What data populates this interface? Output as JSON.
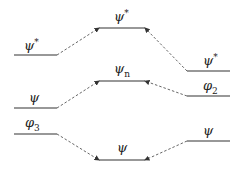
{
  "diagram": {
    "type": "orbital-energy-level-diagram",
    "levels": [
      {
        "id": "left-top",
        "label": "ψ",
        "sup": "*",
        "sub": "",
        "x1": 14,
        "x2": 57,
        "y": 55,
        "lx": 24,
        "ly": 38
      },
      {
        "id": "center-top",
        "label": "ψ",
        "sup": "*",
        "sub": "",
        "x1": 99,
        "x2": 145,
        "y": 28,
        "lx": 114,
        "ly": 9
      },
      {
        "id": "right-top",
        "label": "ψ",
        "sup": "*",
        "sub": "",
        "x1": 187,
        "x2": 230,
        "y": 71,
        "lx": 203,
        "ly": 53
      },
      {
        "id": "left-middle",
        "label": "ψ",
        "sup": "",
        "sub": "",
        "x1": 14,
        "x2": 57,
        "y": 108,
        "lx": 29,
        "ly": 91
      },
      {
        "id": "center-middle",
        "label": "ψ",
        "sup": "",
        "sub": "n",
        "x1": 99,
        "x2": 145,
        "y": 81,
        "lx": 114,
        "ly": 62
      },
      {
        "id": "right-middle",
        "label": "φ",
        "sup": "",
        "sub": "2",
        "x1": 187,
        "x2": 230,
        "y": 96,
        "lx": 203,
        "ly": 79
      },
      {
        "id": "left-bottom",
        "label": "φ",
        "sup": "",
        "sub": "3",
        "x1": 14,
        "x2": 57,
        "y": 134,
        "lx": 25,
        "ly": 116
      },
      {
        "id": "center-bottom",
        "label": "ψ",
        "sup": "",
        "sub": "",
        "x1": 99,
        "x2": 145,
        "y": 160,
        "lx": 117,
        "ly": 141
      },
      {
        "id": "right-bottom",
        "label": "ψ",
        "sup": "",
        "sub": "",
        "x1": 187,
        "x2": 230,
        "y": 141,
        "lx": 203,
        "ly": 124
      }
    ],
    "connectors": [
      {
        "from": "left-top",
        "to": "center-top",
        "x1": 57,
        "y1": 55,
        "x2": 99,
        "y2": 28
      },
      {
        "from": "right-top",
        "to": "center-top",
        "x1": 187,
        "y1": 71,
        "x2": 145,
        "y2": 28
      },
      {
        "from": "left-middle",
        "to": "center-middle",
        "x1": 57,
        "y1": 108,
        "x2": 99,
        "y2": 81
      },
      {
        "from": "right-middle",
        "to": "center-middle",
        "x1": 187,
        "y1": 96,
        "x2": 145,
        "y2": 81
      },
      {
        "from": "left-bottom",
        "to": "center-bottom",
        "x1": 57,
        "y1": 134,
        "x2": 99,
        "y2": 160
      },
      {
        "from": "right-bottom",
        "to": "center-bottom",
        "x1": 187,
        "y1": 141,
        "x2": 145,
        "y2": 160
      }
    ],
    "colors": {
      "line": "#333333",
      "dash": "#555555",
      "text": "#222222"
    }
  }
}
